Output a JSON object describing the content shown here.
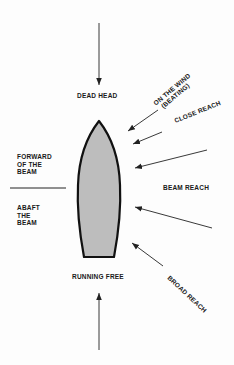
{
  "diagram": {
    "labels": {
      "dead_head": "DEAD HEAD",
      "on_the_wind_1": "ON THE WIND",
      "on_the_wind_2": "(BEATING)",
      "close_reach": "CLOSE REACH",
      "forward_1": "FORWARD",
      "forward_2": "OF THE",
      "forward_3": "BEAM",
      "abaft_1": "ABAFT",
      "abaft_2": "THE",
      "abaft_3": "BEAM",
      "beam_reach": "BEAM REACH",
      "running_free": "RUNNING FREE",
      "broad_reach": "BROAD REACH"
    },
    "colors": {
      "hull_fill": "#bdbdbd",
      "hull_stroke": "#111111",
      "arrow": "#222222",
      "text": "#1a1a1a"
    },
    "arrows": [
      {
        "name": "dead-head-wind",
        "from": [
          99,
          23
        ],
        "to": [
          99,
          85
        ]
      },
      {
        "name": "on-the-wind",
        "from": [
          158,
          110
        ],
        "to": [
          128,
          131
        ]
      },
      {
        "name": "close-reach",
        "from": [
          162,
          132
        ],
        "to": [
          133,
          144
        ]
      },
      {
        "name": "beam-reach-fore",
        "from": [
          207,
          150
        ],
        "to": [
          135,
          168
        ]
      },
      {
        "name": "beam-reach-aft",
        "from": [
          212,
          228
        ],
        "to": [
          135,
          207
        ]
      },
      {
        "name": "broad-reach",
        "from": [
          163,
          266
        ],
        "to": [
          132,
          243
        ]
      },
      {
        "name": "running-free-wind",
        "from": [
          99,
          350
        ],
        "to": [
          99,
          293
        ]
      }
    ]
  }
}
